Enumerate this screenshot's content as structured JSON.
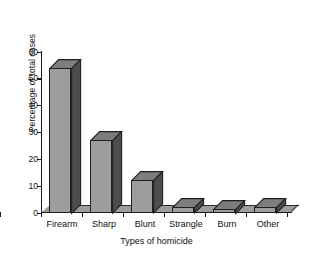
{
  "chart_data": {
    "type": "bar",
    "title": "",
    "subtitle": "",
    "xlabel": "Types of homicide",
    "ylabel": "Percentage of total cases",
    "categories": [
      "Firearm",
      "Sharp",
      "Blunt",
      "Strangle",
      "Burn",
      "Other"
    ],
    "values": [
      54,
      27,
      12,
      2,
      1.5,
      2
    ],
    "ylim": [
      0,
      60
    ],
    "yticks": [
      0,
      10,
      20,
      30,
      40,
      50,
      60
    ],
    "ytick_labels": [
      "0",
      "10",
      "20",
      "30",
      "40",
      "50",
      "60"
    ],
    "grid": false,
    "legend": false,
    "legend_position": "none",
    "style": "3d-bar-grayscale",
    "colors": {
      "bar_face": "#9d9d9d",
      "bar_side": "#4d4d4d",
      "bar_top": "#7d7d7d",
      "outline": "#1f1f1f",
      "axis": "#1a1a1a",
      "background": "#ffffff",
      "text": "#111111"
    }
  }
}
